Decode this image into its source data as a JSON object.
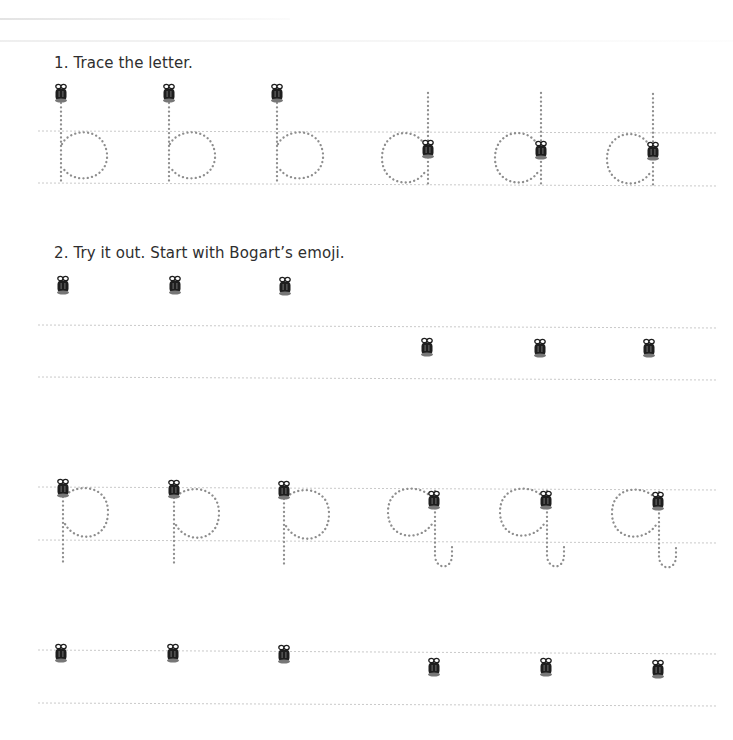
{
  "worksheet": {
    "section1": {
      "instruction": "1. Trace the letter.",
      "letters": [
        "b",
        "b",
        "b",
        "d",
        "d",
        "d"
      ],
      "start_icon": "bogart-emoji-icon"
    },
    "section2": {
      "instruction": "2. Try it out. Start with Bogart’s emoji.",
      "start_icon": "bogart-emoji-icon",
      "practice_rows": 1
    },
    "section3": {
      "letters": [
        "p",
        "p",
        "p",
        "q",
        "q",
        "q"
      ],
      "start_icon": "bogart-emoji-icon"
    },
    "section4": {
      "start_icon": "bogart-emoji-icon",
      "practice_rows": 1
    }
  },
  "colors": {
    "text": "#2e2e2e",
    "trace_dots": "#8e8e8e",
    "guide_lines": "#c9c9c9",
    "emoji_body": "#1e1e1e"
  }
}
